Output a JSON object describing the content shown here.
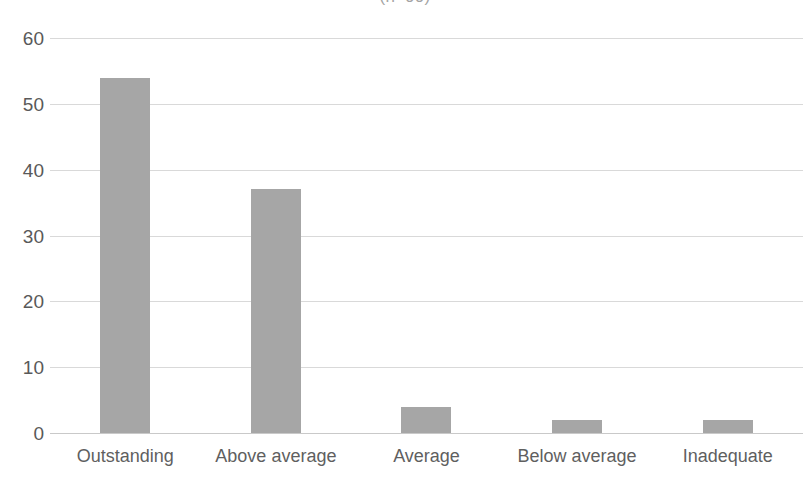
{
  "chart_data": {
    "type": "bar",
    "title": "(n=99)",
    "title_clipped": true,
    "categories": [
      "Outstanding",
      "Above average",
      "Average",
      "Below average",
      "Inadequate"
    ],
    "values": [
      54,
      37,
      4,
      2,
      2
    ],
    "series": [
      {
        "name": "Responses",
        "values": [
          54,
          37,
          4,
          2,
          2
        ]
      }
    ],
    "xlabel": "",
    "ylabel": "",
    "ylim": [
      0,
      60
    ],
    "yticks": [
      0,
      10,
      20,
      30,
      40,
      50,
      60
    ],
    "ytick_labels": [
      "0",
      "10",
      "20",
      "30",
      "40",
      "50",
      "60"
    ],
    "grid": true,
    "grid_axis": "y",
    "legend": false,
    "legend_position": "none",
    "colors": {
      "bar_fill": "#a6a6a6",
      "gridline": "#d9d9d9",
      "axis_line": "#c9c9c9",
      "tick_label": "#595959",
      "category_label": "#5f5f5f",
      "background": "#ffffff"
    }
  }
}
